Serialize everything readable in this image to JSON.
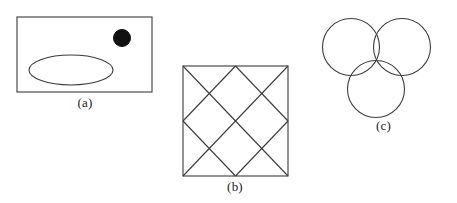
{
  "figure": {
    "background_color": "#ffffff",
    "stroke_color": "#3b3b3b",
    "fill_color": "#111111",
    "width": 457,
    "height": 203,
    "panel_count": 3
  },
  "panels": [
    {
      "id": "a",
      "caption": "(a)",
      "description": "rectangle containing an ellipse and a filled black circle",
      "shapes": [
        {
          "name": "bounding-rectangle",
          "type": "rect",
          "x": 17,
          "y": 17,
          "width": 135,
          "height": 75,
          "fill": "none",
          "stroke": "#3b3b3b",
          "stroke_width": 1.1
        },
        {
          "name": "ellipse-outline",
          "type": "ellipse",
          "cx": 71,
          "cy": 70,
          "rx": 42,
          "ry": 15,
          "fill": "none",
          "stroke": "#3b3b3b",
          "stroke_width": 1.1
        },
        {
          "name": "filled-dot",
          "type": "circle",
          "cx": 122,
          "cy": 38,
          "r": 8.5,
          "fill": "#111111",
          "stroke": "#111111",
          "stroke_width": 1
        }
      ]
    },
    {
      "id": "b",
      "caption": "(b)",
      "description": "square with corner diagonals and an inscribed rotated square connecting side midpoints, forming a diamond lattice",
      "shapes": [
        {
          "name": "bounding-square",
          "type": "rect",
          "x": 13,
          "y": 11,
          "width": 105,
          "height": 110,
          "fill": "none",
          "stroke": "#3b3b3b",
          "stroke_width": 1.1
        },
        {
          "name": "diagonal-top-left-to-bottom-right",
          "type": "line",
          "x1": 13,
          "y1": 11,
          "x2": 118,
          "y2": 121,
          "stroke": "#3b3b3b",
          "stroke_width": 1.1
        },
        {
          "name": "diagonal-bottom-left-to-top-right",
          "type": "line",
          "x1": 13,
          "y1": 121,
          "x2": 118,
          "y2": 11,
          "stroke": "#3b3b3b",
          "stroke_width": 1.1
        },
        {
          "name": "midpoint-diamond-top-left-edge",
          "type": "line",
          "x1": 65.5,
          "y1": 11,
          "x2": 13,
          "y2": 66,
          "stroke": "#3b3b3b",
          "stroke_width": 1.1
        },
        {
          "name": "midpoint-diamond-top-right-edge",
          "type": "line",
          "x1": 65.5,
          "y1": 11,
          "x2": 118,
          "y2": 66,
          "stroke": "#3b3b3b",
          "stroke_width": 1.1
        },
        {
          "name": "midpoint-diamond-bottom-left-edge",
          "type": "line",
          "x1": 13,
          "y1": 66,
          "x2": 65.5,
          "y2": 121,
          "stroke": "#3b3b3b",
          "stroke_width": 1.1
        },
        {
          "name": "midpoint-diamond-bottom-right-edge",
          "type": "line",
          "x1": 118,
          "y1": 66,
          "x2": 65.5,
          "y2": 121,
          "stroke": "#3b3b3b",
          "stroke_width": 1.1
        }
      ]
    },
    {
      "id": "c",
      "caption": "(c)",
      "description": "three mutually overlapping circles arranged in a triangle (Venn-style diagram)",
      "shapes": [
        {
          "name": "circle-top-left",
          "type": "circle",
          "cx": 41,
          "cy": 47,
          "r": 28.5,
          "fill": "none",
          "stroke": "#3b3b3b",
          "stroke_width": 1.1
        },
        {
          "name": "circle-top-right",
          "type": "circle",
          "cx": 92,
          "cy": 47,
          "r": 28.5,
          "fill": "none",
          "stroke": "#3b3b3b",
          "stroke_width": 1.1
        },
        {
          "name": "circle-bottom-center",
          "type": "circle",
          "cx": 66,
          "cy": 89,
          "r": 28.5,
          "fill": "none",
          "stroke": "#3b3b3b",
          "stroke_width": 1.1
        }
      ]
    }
  ]
}
